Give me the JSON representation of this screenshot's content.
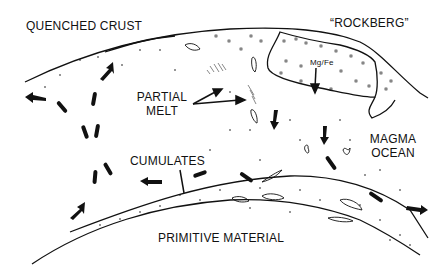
{
  "diagram": {
    "labels": {
      "quenched_crust": "QUENCHED CRUST",
      "rockberg": "“ROCKBERG”",
      "mg_fe": "Mg/Fe",
      "partial_melt_line1": "PARTIAL",
      "partial_melt_line2": "MELT",
      "magma_ocean_line1": "MAGMA",
      "magma_ocean_line2": "OCEAN",
      "cumulates": "CUMULATES",
      "primitive_material": "PRIMITIVE MATERIAL"
    },
    "colors": {
      "ink": "#111111",
      "background": "#ffffff"
    }
  }
}
